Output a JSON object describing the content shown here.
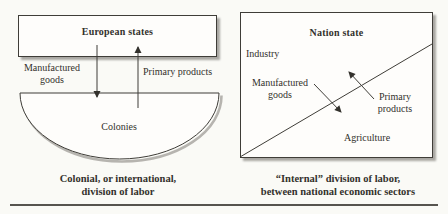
{
  "figure": {
    "left_panel": {
      "top_box_label": "European states",
      "down_flow_label": [
        "Manufactured",
        "goods"
      ],
      "up_flow_label": "Primary products",
      "bottom_shape_label": "Colonies",
      "caption": [
        "Colonial, or international,",
        "division of labor"
      ]
    },
    "right_panel": {
      "box_label": "Nation state",
      "upper_sector_label": "Industry",
      "left_flow_label": [
        "Manufactured",
        "goods"
      ],
      "right_flow_label": [
        "Primary",
        "products"
      ],
      "lower_sector_label": "Agriculture",
      "caption": [
        "“Internal” division of labor,",
        "between national economic sectors"
      ]
    },
    "colors": {
      "background": "#fafaf6",
      "box_fill": "#fefdfb",
      "line": "#3f3d38",
      "shadow": "#a9a7a2",
      "text": "#33312c"
    }
  }
}
